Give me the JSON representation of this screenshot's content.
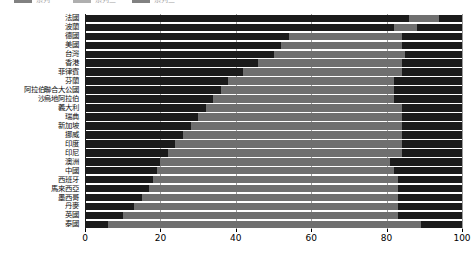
{
  "chart_data": {
    "type": "bar",
    "subtype": "stacked-horizontal-100",
    "title": "",
    "xlabel": "",
    "ylabel": "",
    "xlim": [
      0,
      100
    ],
    "xticks": [
      0,
      20,
      40,
      60,
      80,
      100
    ],
    "grid": true,
    "legend_position": "top-left",
    "orientation": "horizontal",
    "stacked": true,
    "categories": [
      "法國",
      "波蘭",
      "德國",
      "美國",
      "台灣",
      "香港",
      "菲律賓",
      "芬蘭",
      "阿拉伯聯合大公國",
      "沙烏地阿拉伯",
      "義大利",
      "瑞典",
      "新加坡",
      "挪威",
      "印度",
      "印尼",
      "澳洲",
      "中國",
      "西班牙",
      "馬來西亞",
      "墨西哥",
      "丹麥",
      "英國",
      "泰國"
    ],
    "series": [
      {
        "name": "系列一",
        "color": "#1b1b1b",
        "values": [
          86,
          82,
          54,
          52,
          50,
          46,
          42,
          38,
          36,
          34,
          32,
          30,
          28,
          26,
          24,
          22,
          20,
          19,
          18,
          17,
          15,
          13,
          10,
          6
        ]
      },
      {
        "name": "系列二",
        "color": "#6f6f6f",
        "values": [
          8,
          6,
          30,
          32,
          35,
          38,
          42,
          44,
          46,
          48,
          52,
          54,
          56,
          58,
          60,
          62,
          61,
          63,
          65,
          66,
          68,
          70,
          73,
          83
        ]
      },
      {
        "name": "系列三",
        "color": "#1b1b1b",
        "values": [
          6,
          12,
          16,
          16,
          15,
          16,
          16,
          18,
          18,
          18,
          16,
          16,
          16,
          16,
          16,
          16,
          19,
          18,
          17,
          17,
          17,
          17,
          17,
          11
        ]
      }
    ],
    "legend": [
      {
        "label": "系列一",
        "color": "#1b1b1b"
      },
      {
        "label": "系列二",
        "color": "#6f6f6f"
      },
      {
        "label": "系列三",
        "color": "#1b1b1b"
      }
    ]
  }
}
